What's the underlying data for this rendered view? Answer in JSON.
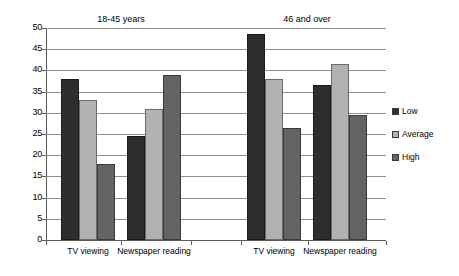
{
  "chart_data": {
    "type": "bar",
    "title": "",
    "subtitle": "",
    "xlabel": "",
    "ylabel": "",
    "ylim": [
      0,
      50
    ],
    "ytick_step": 5,
    "yticks": [
      50,
      45,
      40,
      35,
      30,
      25,
      20,
      15,
      10,
      5,
      0
    ],
    "grid": true,
    "grid_axis": "y",
    "legend_position": "right",
    "group_titles": [
      "18-45 years",
      "46 and over"
    ],
    "categories": [
      "TV viewing",
      "Newspaper reading",
      "TV viewing",
      "Newspaper reading"
    ],
    "groups": [
      {
        "title": "18-45 years",
        "categories": [
          "TV viewing",
          "Newspaper reading"
        ],
        "series": [
          {
            "name": "Low",
            "values": [
              38,
              24.5
            ]
          },
          {
            "name": "Average",
            "values": [
              33,
              31
            ]
          },
          {
            "name": "High",
            "values": [
              18,
              39
            ]
          }
        ]
      },
      {
        "title": "46 and over",
        "categories": [
          "TV viewing",
          "Newspaper reading"
        ],
        "series": [
          {
            "name": "Low",
            "values": [
              48.5,
              36.5
            ]
          },
          {
            "name": "Average",
            "values": [
              38,
              41.5
            ]
          },
          {
            "name": "High",
            "values": [
              26.5,
              29.5
            ]
          }
        ]
      }
    ],
    "series": [
      {
        "name": "Low",
        "color": "#2e2e2e",
        "values": [
          38,
          24.5,
          48.5,
          36.5
        ]
      },
      {
        "name": "Average",
        "color": "#b2b2b2",
        "values": [
          33,
          31,
          38,
          41.5
        ]
      },
      {
        "name": "High",
        "color": "#646464",
        "values": [
          18,
          39,
          26.5,
          29.5
        ]
      }
    ]
  },
  "legend": {
    "items": [
      {
        "label": "Low",
        "color": "#2e2e2e"
      },
      {
        "label": "Average",
        "color": "#b2b2b2"
      },
      {
        "label": "High",
        "color": "#646464"
      }
    ]
  },
  "axis": {
    "y": {
      "labels": [
        "50",
        "45",
        "40",
        "35",
        "30",
        "25",
        "20",
        "15",
        "10",
        "5",
        "0"
      ]
    },
    "x": {
      "labels": [
        "TV viewing",
        "Newspaper reading",
        "TV viewing",
        "Newspaper reading"
      ]
    }
  }
}
